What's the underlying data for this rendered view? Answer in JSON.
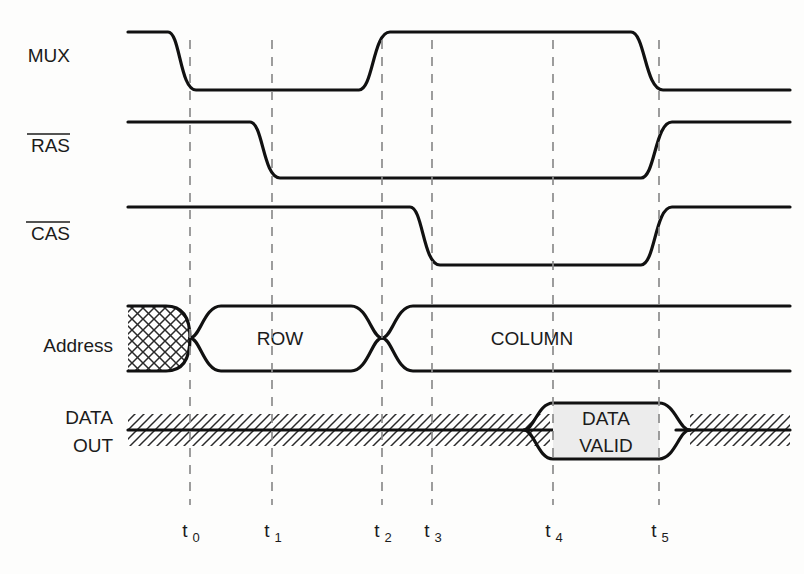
{
  "diagram": {
    "colors": {
      "background": "#fdfdfc",
      "signal_stroke": "#111111",
      "dashed_marker": "#8c8c8c",
      "data_valid_fill": "#ececec",
      "text": "#1b1b1b"
    },
    "signals": [
      {
        "name": "mux",
        "label": "MUX",
        "overbar": false,
        "label_x": 70,
        "label_y": 62,
        "high_y": 32,
        "low_y": 90,
        "type": "logic",
        "transitions": [
          {
            "at": "t0",
            "edge": "fall"
          },
          {
            "at": "t2",
            "edge": "rise"
          },
          {
            "at": "t5",
            "edge": "fall"
          }
        ]
      },
      {
        "name": "ras",
        "label": "RAS",
        "overbar": true,
        "label_x": 70,
        "label_y": 152,
        "high_y": 122,
        "low_y": 178,
        "type": "logic",
        "transitions": [
          {
            "at": "t1",
            "edge": "fall"
          },
          {
            "at": "t5",
            "edge": "rise"
          }
        ]
      },
      {
        "name": "cas",
        "label": "CAS",
        "overbar": true,
        "label_x": 70,
        "label_y": 240,
        "high_y": 207,
        "low_y": 265,
        "type": "logic",
        "transitions": [
          {
            "at": "t3",
            "edge": "fall"
          },
          {
            "at": "t5",
            "edge": "rise"
          }
        ]
      },
      {
        "name": "address",
        "label": "Address",
        "overbar": false,
        "label_x": 84,
        "label_y": 345,
        "top_y": 305,
        "bottom_y": 372,
        "type": "bus",
        "segments": [
          {
            "value": "",
            "style": "crosshatch",
            "from_x": 128,
            "to": "t0"
          },
          {
            "value": "ROW",
            "style": "open",
            "from": "t0",
            "to": "t2",
            "text_x": 280,
            "text_y": 345
          },
          {
            "value": "COLUMN",
            "style": "open",
            "from": "t2",
            "to_x": 790,
            "text_x": 530,
            "text_y": 345
          }
        ]
      },
      {
        "name": "data-out",
        "label": "DATA\nOUT",
        "label_line1": "DATA",
        "label_line2": "OUT",
        "overbar": false,
        "label_x": 84,
        "label_y": 422,
        "label_y2": 448,
        "top_y": 403,
        "bottom_y": 458,
        "mid_y": 430,
        "type": "bus",
        "segments": [
          {
            "value": "",
            "style": "hatched",
            "from_x": 128,
            "to": "t4"
          },
          {
            "value": "DATA VALID",
            "style": "filled",
            "from": "t4",
            "to": "t5",
            "line1": "DATA",
            "line2": "VALID",
            "text_x": 606,
            "text_y": 425,
            "text_y2": 452
          },
          {
            "value": "",
            "style": "hatched",
            "from": "t5",
            "to_x": 790
          }
        ]
      }
    ],
    "time_markers": [
      {
        "id": "t0",
        "label": "t",
        "subscript": "0",
        "x": 190
      },
      {
        "id": "t1",
        "label": "t",
        "subscript": "1",
        "x": 272
      },
      {
        "id": "t2",
        "label": "t",
        "subscript": "2",
        "x": 382
      },
      {
        "id": "t3",
        "label": "t",
        "subscript": "3",
        "x": 432
      },
      {
        "id": "t4",
        "label": "t",
        "subscript": "4",
        "x": 553
      },
      {
        "id": "t5",
        "label": "t",
        "subscript": "5",
        "x": 659
      }
    ],
    "marker_axis": {
      "dash_top_y": 40,
      "dash_bottom_y": 505,
      "tick_label_y": 535
    }
  }
}
